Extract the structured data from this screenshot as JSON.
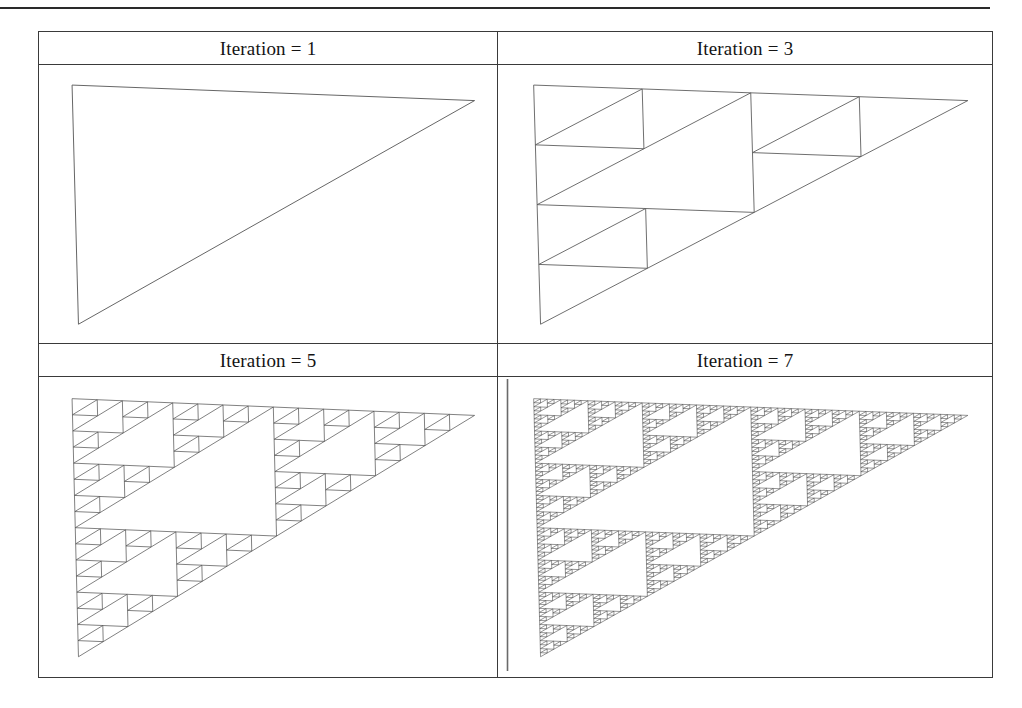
{
  "page": {
    "background_color": "#ffffff",
    "ink_color": "#3a3a3a",
    "rule_color": "#2a2a2a",
    "width": 1022,
    "height": 708
  },
  "top_rule": {
    "name": "horizontal-rule"
  },
  "figure_table": {
    "columns": 2,
    "rows": 2,
    "border_color": "#3a3a3a",
    "cells": [
      {
        "caption": "Iteration = 1",
        "iteration": 1,
        "depth": 0,
        "stroke": "#555555",
        "stroke_width": 0.9
      },
      {
        "caption": "Iteration = 3",
        "iteration": 3,
        "depth": 2,
        "stroke": "#555555",
        "stroke_width": 0.85
      },
      {
        "caption": "Iteration = 5",
        "iteration": 5,
        "depth": 4,
        "stroke": "#4a4a4a",
        "stroke_width": 0.7
      },
      {
        "caption": "Iteration = 7",
        "iteration": 7,
        "depth": 6,
        "stroke": "#3f3f3f",
        "stroke_width": 0.55
      }
    ]
  },
  "chart_data": {
    "type": "diagram",
    "figure_kind": "recursive-right-triangle-fractal",
    "panels": [
      {
        "label": "Iteration = 1",
        "iteration": 1,
        "recursion_depth": 0,
        "triangle_count": 1
      },
      {
        "label": "Iteration = 3",
        "iteration": 3,
        "recursion_depth": 2,
        "triangle_count": 9
      },
      {
        "label": "Iteration = 5",
        "iteration": 5,
        "recursion_depth": 4,
        "triangle_count": 81
      },
      {
        "label": "Iteration = 7",
        "iteration": 7,
        "recursion_depth": 6,
        "triangle_count": 729
      }
    ],
    "triangle_vertices_normalized": {
      "top_left": [
        0.04,
        0.04
      ],
      "top_right": [
        0.985,
        0.1
      ],
      "bottom_left": [
        0.055,
        0.965
      ]
    },
    "subdivision_rule": "replace each right triangle by 3 half-scale copies at the two legs' ends and the hypotenuse midpoint; the central inverted region is left empty"
  }
}
